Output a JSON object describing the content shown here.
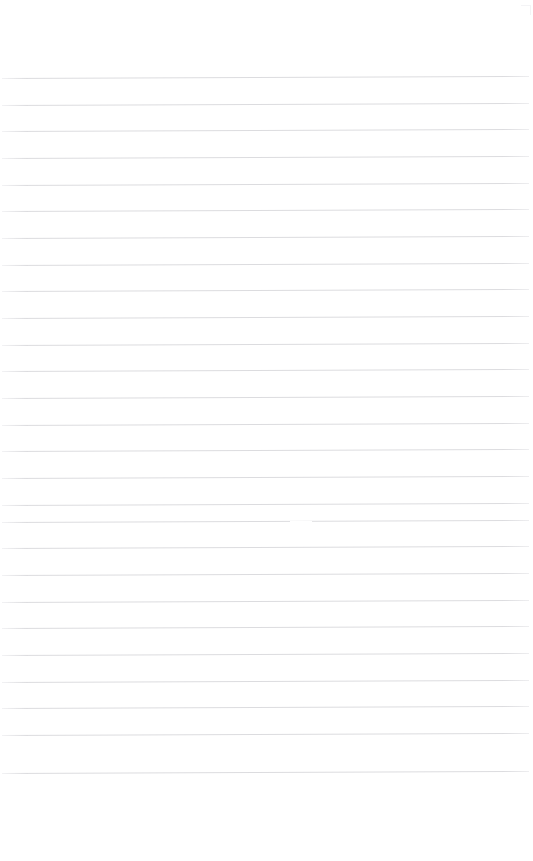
{
  "page": {
    "kind": "scanned-lined-paper",
    "width": 533,
    "height": 861,
    "background_color": "#ffffff",
    "content_text": "",
    "handwriting_present": "no",
    "printed_text_present": "no"
  },
  "ruling": {
    "label": "horizontal ruled lines",
    "line_color": "#dcdcdf",
    "line_thickness_px": 1,
    "line_count": 27,
    "first_line_y": 78,
    "last_line_y": 773,
    "line_spacing_px": 26.7,
    "line_start_x": 2,
    "line_end_x": 529,
    "skew_rise_px": -2,
    "vertical_margin_rule": "none",
    "line_y_positions": [
      78,
      105,
      131,
      158,
      185,
      211,
      238,
      265,
      291,
      318,
      345,
      371,
      398,
      425,
      451,
      478,
      505,
      522,
      548,
      575,
      602,
      628,
      655,
      682,
      708,
      735,
      773
    ]
  },
  "margins": {
    "top_blank_px": 78,
    "bottom_blank_px": 88,
    "left_blank_px": 2,
    "right_blank_px": 4
  },
  "artifacts": {
    "erasure_gap": {
      "label": "faint gap in rule",
      "x": 290,
      "y": 521,
      "width": 22,
      "height": 3
    },
    "corner_speck": {
      "label": "faint corner scan speck",
      "x": 521,
      "y": 5,
      "size": 9
    }
  }
}
